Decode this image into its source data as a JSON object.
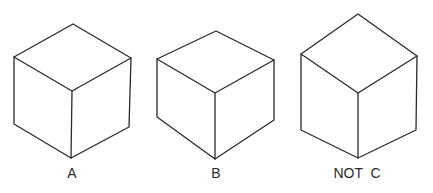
{
  "figure": {
    "cubes": [
      {
        "id": "A",
        "label": "A"
      },
      {
        "id": "B",
        "label": "B"
      },
      {
        "id": "C",
        "label": "NOT  C"
      }
    ]
  }
}
